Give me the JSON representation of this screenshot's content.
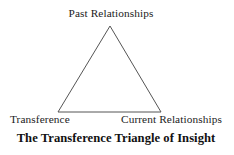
{
  "figure": {
    "caption": "The Transference Triangle of Insight",
    "background_color": "#ffffff",
    "text_color": "#1c1c1c"
  },
  "diagram": {
    "type": "triangle",
    "stroke_color": "#555555",
    "stroke_width": 1,
    "fill": "none",
    "vertices": [
      {
        "id": "apex",
        "label": "Past Relationships",
        "x": 110,
        "y": 26
      },
      {
        "id": "bottom-left",
        "label": "Transference",
        "x": 58,
        "y": 112
      },
      {
        "id": "bottom-right",
        "label": "Current Relationships",
        "x": 161,
        "y": 112
      }
    ],
    "points_path": "110,26 161,112 58,112"
  },
  "labels": {
    "apex": "Past Relationships",
    "bottom_left": "Transference",
    "bottom_right": "Current Relationships"
  }
}
